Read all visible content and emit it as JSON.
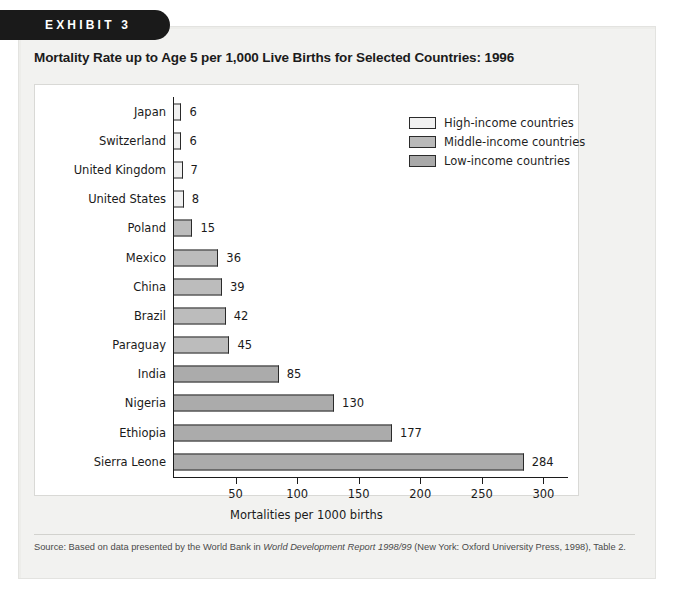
{
  "exhibit": {
    "banner_label": "EXHIBIT 3"
  },
  "chart_data": {
    "type": "bar",
    "orientation": "horizontal",
    "title": "Mortality Rate up to Age 5 per 1,000 Live Births for Selected Countries: 1996",
    "xlabel": "Mortalities per 1000 births",
    "ylabel": "",
    "xlim": [
      0,
      320
    ],
    "xticks": [
      50,
      100,
      150,
      200,
      250,
      300
    ],
    "grid": false,
    "legend_position": "top-right",
    "legend": [
      {
        "name": "High-income countries",
        "color": "#f1f1f1"
      },
      {
        "name": "Middle-income countries",
        "color": "#bcbcbc"
      },
      {
        "name": "Low-income countries",
        "color": "#ababab"
      }
    ],
    "categories": [
      "Japan",
      "Switzerland",
      "United Kingdom",
      "United States",
      "Poland",
      "Mexico",
      "China",
      "Brazil",
      "Paraguay",
      "India",
      "Nigeria",
      "Ethiopia",
      "Sierra Leone"
    ],
    "values": [
      6,
      6,
      7,
      8,
      15,
      36,
      39,
      42,
      45,
      85,
      130,
      177,
      284
    ],
    "groups": [
      "high",
      "high",
      "high",
      "high",
      "middle",
      "middle",
      "middle",
      "middle",
      "middle",
      "low",
      "low",
      "low",
      "low"
    ],
    "bars": [
      {
        "category": "Japan",
        "value": 6,
        "label": "6",
        "group": "high"
      },
      {
        "category": "Switzerland",
        "value": 6,
        "label": "6",
        "group": "high"
      },
      {
        "category": "United Kingdom",
        "value": 7,
        "label": "7",
        "group": "high"
      },
      {
        "category": "United States",
        "value": 8,
        "label": "8",
        "group": "high"
      },
      {
        "category": "Poland",
        "value": 15,
        "label": "15",
        "group": "middle"
      },
      {
        "category": "Mexico",
        "value": 36,
        "label": "36",
        "group": "middle"
      },
      {
        "category": "China",
        "value": 39,
        "label": "39",
        "group": "middle"
      },
      {
        "category": "Brazil",
        "value": 42,
        "label": "42",
        "group": "middle"
      },
      {
        "category": "Paraguay",
        "value": 45,
        "label": "45",
        "group": "middle"
      },
      {
        "category": "India",
        "value": 85,
        "label": "85",
        "group": "low"
      },
      {
        "category": "Nigeria",
        "value": 130,
        "label": "130",
        "group": "low"
      },
      {
        "category": "Ethiopia",
        "value": 177,
        "label": "177",
        "group": "low"
      },
      {
        "category": "Sierra Leone",
        "value": 284,
        "label": "284",
        "group": "low"
      }
    ]
  },
  "source": {
    "prefix": "Source: Based on data presented by the World Bank in ",
    "italic": "World Development Report 1998/99",
    "suffix": " (New York: Oxford University Press, 1998), Table 2."
  }
}
